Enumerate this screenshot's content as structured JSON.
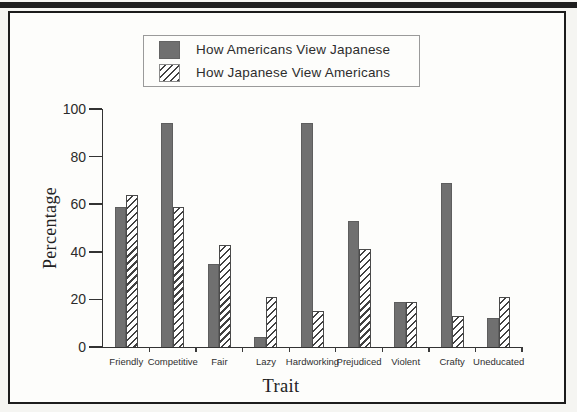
{
  "colors": {
    "solid_bar": "#707070",
    "hatch_line": "#414141",
    "axis": "#333333",
    "frame_border": "#1c1c1c",
    "legend_border": "#9a9a9a",
    "top_rule": "#1e1e1e"
  },
  "chart_data": {
    "type": "bar",
    "title": "",
    "xlabel": "Trait",
    "ylabel": "Percentage",
    "ylim": [
      0,
      100
    ],
    "yticks": [
      0,
      20,
      40,
      60,
      80,
      100
    ],
    "grid": "off",
    "legend_position": "top-center-inside-framed-box",
    "categories": [
      "Friendly",
      "Competitive",
      "Fair",
      "Lazy",
      "Hardworking",
      "Prejudiced",
      "Violent",
      "Crafty",
      "Uneducated"
    ],
    "series": [
      {
        "name": "How Americans View Japanese",
        "style": "solid-gray",
        "values": [
          59,
          94,
          35,
          4,
          94,
          53,
          19,
          69,
          12
        ]
      },
      {
        "name": "How Japanese View Americans",
        "style": "diagonal-hatch",
        "values": [
          64,
          59,
          43,
          21,
          15,
          41,
          19,
          13,
          21
        ]
      }
    ]
  }
}
